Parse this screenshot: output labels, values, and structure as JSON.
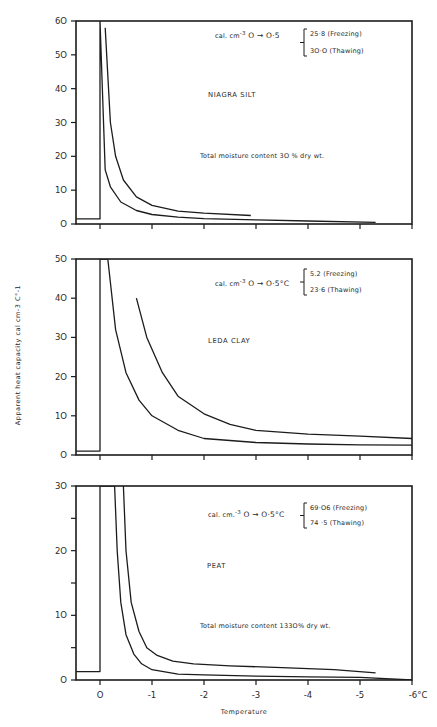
{
  "chart_data": {
    "type": "line",
    "figure_layout": "3 vertically stacked panels sharing x-axis",
    "xlabel": "Temperature",
    "ylabel": "Apparent heat capacity cal cm-3 C°-1",
    "x_ticks": [
      0,
      -1,
      -2,
      -3,
      -4,
      -5,
      -6
    ],
    "x_tick_labels": [
      "O",
      "-1",
      "-2",
      "-3",
      "-4",
      "-5",
      "-6°C"
    ],
    "xlim": [
      0.46,
      -6
    ],
    "grid": false,
    "panels": [
      {
        "id": "niagra",
        "title": "NIAGRA SILT",
        "ylim": [
          0,
          60
        ],
        "y_ticks": [
          0,
          10,
          20,
          30,
          40,
          50,
          60
        ],
        "y_tick_labels": [
          "O",
          "1O",
          "2O",
          "3O",
          "4O",
          "5O",
          "6O"
        ],
        "annotation_formula": "cal. cm-3 O → O·5",
        "annotation_values": [
          "25·8 (Freezing)",
          "3O·O (Thawing)"
        ],
        "annotation_moisture": "Total moisture content  3O % dry wt.",
        "series": [
          {
            "name": "Freezing",
            "x": [
              0.46,
              0.0,
              0.0,
              -0.1,
              -0.2,
              -0.4,
              -0.7,
              -1.0,
              -1.5,
              -2.0,
              -3.0,
              -4.0,
              -5.3
            ],
            "y": [
              1.5,
              1.5,
              60,
              16,
              11,
              6.5,
              4.0,
              2.8,
              2.0,
              1.6,
              1.2,
              0.9,
              0.5
            ]
          },
          {
            "name": "Thawing",
            "x": [
              -0.1,
              -0.2,
              -0.3,
              -0.45,
              -0.7,
              -1.0,
              -1.5,
              -2.0,
              -2.9
            ],
            "y": [
              58,
              30,
              20,
              13,
              8,
              5.5,
              3.8,
              3.2,
              2.5
            ]
          }
        ]
      },
      {
        "id": "leda",
        "title": "LEDA CLAY",
        "ylim": [
          0,
          50
        ],
        "y_ticks": [
          0,
          10,
          20,
          30,
          40,
          50
        ],
        "y_tick_labels": [
          "O",
          "1O",
          "2O",
          "3O",
          "4O",
          "5O"
        ],
        "annotation_formula": "cal. cm-3 O → O·5°C",
        "annotation_values": [
          "5.2 (Freezing)",
          "23·6 (Thawing)"
        ],
        "annotation_moisture": "",
        "series": [
          {
            "name": "Freezing",
            "x": [
              0.46,
              0.0,
              0.0,
              -0.15,
              -0.3,
              -0.5,
              -0.75,
              -1.0,
              -1.5,
              -2.0,
              -3.0,
              -4.0,
              -5.0,
              -6.0
            ],
            "y": [
              1,
              1,
              50,
              50,
              32,
              21,
              14,
              10,
              6.3,
              4.2,
              3.2,
              2.8,
              2.6,
              2.5
            ]
          },
          {
            "name": "Thawing",
            "x": [
              -0.7,
              -0.9,
              -1.2,
              -1.5,
              -2.0,
              -2.5,
              -3.0,
              -4.0,
              -5.0,
              -6.0
            ],
            "y": [
              40,
              30,
              21,
              15,
              10.5,
              7.8,
              6.3,
              5.3,
              4.8,
              4.2
            ]
          }
        ]
      },
      {
        "id": "peat",
        "title": "PEAT",
        "ylim": [
          0,
          30
        ],
        "y_ticks": [
          0,
          5,
          10,
          15,
          20,
          25,
          30
        ],
        "y_tick_labels": [
          "O",
          "",
          "1O",
          "",
          "2O",
          "",
          "3O"
        ],
        "annotation_formula": "cal. cm.-3 O → O·5°C",
        "annotation_values": [
          "69·O6 (Freezing)",
          "74 ·5   (Thawing)"
        ],
        "annotation_moisture": "Total moisture content  133O% dry wt.",
        "series": [
          {
            "name": "Freezing",
            "x": [
              0.46,
              0.0,
              0.0,
              -0.28,
              -0.33,
              -0.4,
              -0.5,
              -0.65,
              -0.8,
              -1.0,
              -1.5,
              -2.0,
              -3.0,
              -4.0,
              -5.0,
              -6.0
            ],
            "y": [
              1.3,
              1.3,
              30,
              30,
              20,
              12,
              7,
              4,
              2.5,
              1.6,
              0.9,
              0.8,
              0.6,
              0.5,
              0.4,
              0.0
            ]
          },
          {
            "name": "Thawing",
            "x": [
              -0.45,
              -0.5,
              -0.6,
              -0.75,
              -0.9,
              -1.1,
              -1.4,
              -1.8,
              -2.5,
              -3.5,
              -4.5,
              -5.3
            ],
            "y": [
              30,
              20,
              12,
              7.5,
              5,
              3.8,
              2.9,
              2.5,
              2.2,
              1.9,
              1.6,
              1.1
            ]
          }
        ]
      }
    ]
  },
  "labels": {
    "xlabel": "Temperature",
    "ylabel": "Apparent heat capacity cal cm-3 C°-1",
    "panels": [
      {
        "title": "NIAGRA SILT",
        "formula_prefix": "cal. cm",
        "formula_sup": "-3",
        "formula_rest": " O → O·5",
        "freezing": "25·8 (Freezing)",
        "thawing": "3O·O (Thawing)",
        "moisture": "Total moisture content  3O % dry wt."
      },
      {
        "title": "LEDA CLAY",
        "formula_prefix": "cal. cm",
        "formula_sup": "-3",
        "formula_rest": " O → O·5°C",
        "freezing": "5.2 (Freezing)",
        "thawing": "23·6 (Thawing)",
        "moisture": ""
      },
      {
        "title": "PEAT",
        "formula_prefix": "cal. cm.",
        "formula_sup": "-3",
        "formula_rest": " O → O·5°C",
        "freezing": "69·O6 (Freezing)",
        "thawing": "74 ·5   (Thawing)",
        "moisture": "Total moisture content  133O% dry wt."
      }
    ]
  },
  "colors": {
    "ink": "#1c1c1c",
    "paper": "#ffffff"
  }
}
